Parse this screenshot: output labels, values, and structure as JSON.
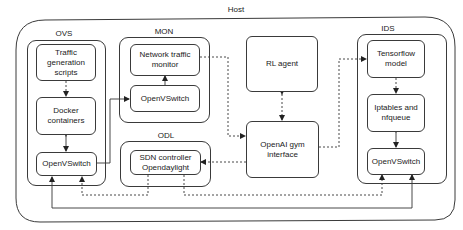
{
  "host": {
    "label": "Host"
  },
  "groups": {
    "ovs": {
      "label": "OVS"
    },
    "mon": {
      "label": "MON"
    },
    "odl": {
      "label": "ODL"
    },
    "ids": {
      "label": "IDS"
    }
  },
  "nodes": {
    "traffic_gen": "Traffic generation scripts",
    "docker": "Docker containers",
    "ovs_switch": "OpenVSwitch",
    "net_monitor": "Network traffic monitor",
    "mon_switch": "OpenVSwitch",
    "sdn": "SDN controller Opendaylight",
    "rl_agent": "RL agent",
    "gym": "OpenAI gym interface",
    "tensorflow": "Tensorflow model",
    "iptables": "Iptables and nfqueue",
    "ids_switch": "OpenVSwitch"
  },
  "edges": [
    {
      "from": "traffic_gen",
      "to": "docker",
      "style": "dashed"
    },
    {
      "from": "docker",
      "to": "ovs_switch",
      "style": "solid",
      "bidirectional": true
    },
    {
      "from": "ovs_switch",
      "to": "mon_switch",
      "style": "solid"
    },
    {
      "from": "mon_switch",
      "to": "net_monitor",
      "style": "solid"
    },
    {
      "from": "net_monitor",
      "to": "gym",
      "style": "dashed"
    },
    {
      "from": "rl_agent",
      "to": "gym",
      "style": "dashed",
      "bidirectional": true
    },
    {
      "from": "gym",
      "to": "tensorflow",
      "style": "dashed"
    },
    {
      "from": "gym",
      "to": "sdn",
      "style": "dashed"
    },
    {
      "from": "tensorflow",
      "to": "iptables",
      "style": "dashed"
    },
    {
      "from": "iptables",
      "to": "ids_switch",
      "style": "solid",
      "bidirectional": true
    },
    {
      "from": "sdn",
      "to": "ovs_switch",
      "style": "dashed"
    },
    {
      "from": "sdn",
      "to": "ids_switch",
      "style": "dashed"
    },
    {
      "from": "ids_switch",
      "to": "ovs_switch",
      "style": "solid"
    }
  ]
}
